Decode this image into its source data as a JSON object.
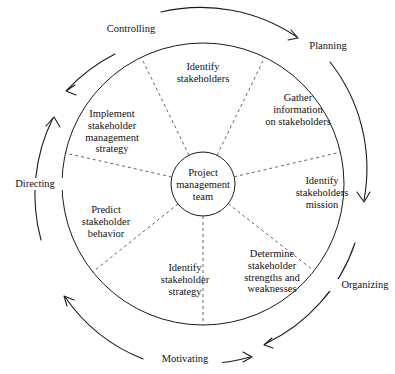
{
  "diagram": {
    "type": "cycle-wheel",
    "colors": {
      "stroke": "#1a1a1a",
      "dashed_stroke": "#555555",
      "text": "#111111",
      "background": "#ffffff"
    },
    "hub": {
      "name": "project-management-team",
      "lines": [
        "Project",
        "management",
        "team"
      ]
    },
    "wedges": [
      {
        "id": "identify-stakeholders",
        "lines": [
          "Identify",
          "stakeholders"
        ]
      },
      {
        "id": "gather-information",
        "lines": [
          "Gather",
          "information",
          "on stakeholders"
        ]
      },
      {
        "id": "identify-stakeholders-mission",
        "lines": [
          "Identify",
          "stakeholders",
          "mission"
        ]
      },
      {
        "id": "determine-strengths-weaknesses",
        "lines": [
          "Determine",
          "stakeholder",
          "strengths and",
          "weaknesses"
        ]
      },
      {
        "id": "identify-stakeholder-strategy",
        "lines": [
          "Identify",
          "stakeholder",
          "strategy"
        ]
      },
      {
        "id": "predict-stakeholder-behavior",
        "lines": [
          "Predict",
          "stakeholder",
          "behavior"
        ]
      },
      {
        "id": "implement-management-strategy",
        "lines": [
          "Implement",
          "stakeholder",
          "management",
          "strategy"
        ]
      }
    ],
    "phases": [
      {
        "id": "planning",
        "label": "Planning"
      },
      {
        "id": "organizing",
        "label": "Organizing"
      },
      {
        "id": "motivating",
        "label": "Motivating"
      },
      {
        "id": "directing",
        "label": "Directing"
      },
      {
        "id": "controlling",
        "label": "Controlling"
      }
    ]
  }
}
